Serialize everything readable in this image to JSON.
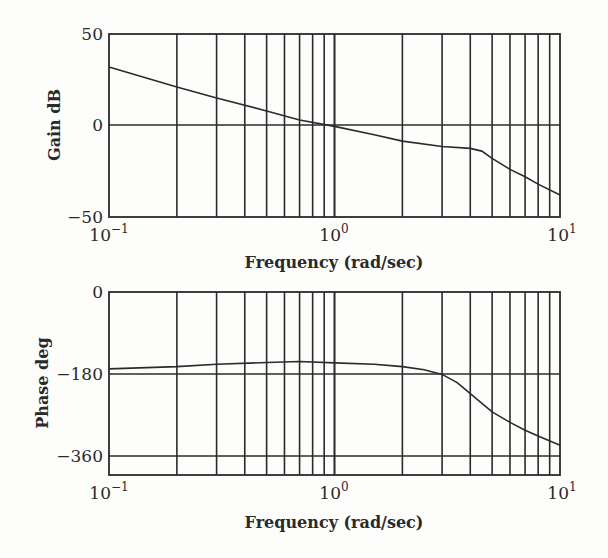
{
  "chart_data": [
    {
      "type": "line",
      "title": "",
      "xlabel": "Frequency (rad/sec)",
      "ylabel": "Gain dB",
      "xscale": "log",
      "xlim": [
        0.1,
        10
      ],
      "ylim": [
        -50,
        50
      ],
      "grid": true,
      "x_tick_labels": [
        "10^-1",
        "10^0",
        "10^1"
      ],
      "y_tick_labels": [
        "50",
        "0",
        "-50"
      ],
      "y_grid_values": [
        0
      ],
      "x": [
        0.1,
        0.2,
        0.3,
        0.5,
        0.7,
        1.0,
        1.5,
        2.0,
        3.0,
        4.0,
        4.5,
        5.0,
        6.0,
        7.0,
        8.0,
        10.0
      ],
      "series": [
        {
          "name": "Gain",
          "values": [
            32,
            21,
            15,
            8,
            3,
            -0.5,
            -5,
            -8.5,
            -11.5,
            -12.5,
            -14,
            -18,
            -24,
            -28,
            -32,
            -38
          ]
        }
      ]
    },
    {
      "type": "line",
      "title": "",
      "xlabel": "Frequency (rad/sec)",
      "ylabel": "Phase deg",
      "xscale": "log",
      "xlim": [
        0.1,
        10
      ],
      "ylim": [
        -400,
        0
      ],
      "grid": true,
      "x_tick_labels": [
        "10^-1",
        "10^0",
        "10^1"
      ],
      "y_tick_labels": [
        "0",
        "-180",
        "-360"
      ],
      "y_grid_values": [
        -180,
        -360
      ],
      "x": [
        0.1,
        0.2,
        0.3,
        0.5,
        0.7,
        1.0,
        1.5,
        2.0,
        2.5,
        3.0,
        3.5,
        4.0,
        5.0,
        6.0,
        7.0,
        8.0,
        10.0
      ],
      "series": [
        {
          "name": "Phase",
          "values": [
            -168,
            -163,
            -158,
            -154,
            -152,
            -155,
            -158,
            -163,
            -170,
            -180,
            -198,
            -222,
            -262,
            -285,
            -302,
            -315,
            -335
          ]
        }
      ]
    }
  ],
  "gain_plot": {
    "ylabel": "Gain dB",
    "y_ticks": [
      "50",
      "0",
      "−50"
    ],
    "x_ticks": [
      {
        "base": "10",
        "exp": "−1"
      },
      {
        "base": "10",
        "exp": "0"
      },
      {
        "base": "10",
        "exp": "1"
      }
    ],
    "xlabel": "Frequency (rad/sec)"
  },
  "phase_plot": {
    "ylabel": "Phase deg",
    "y_ticks": [
      "0",
      "−180",
      "−360"
    ],
    "x_ticks": [
      {
        "base": "10",
        "exp": "−1"
      },
      {
        "base": "10",
        "exp": "0"
      },
      {
        "base": "10",
        "exp": "1"
      }
    ],
    "xlabel": "Frequency (rad/sec)"
  },
  "colors": {
    "line": "#2b2b2b",
    "background": "#fdfdfb"
  }
}
